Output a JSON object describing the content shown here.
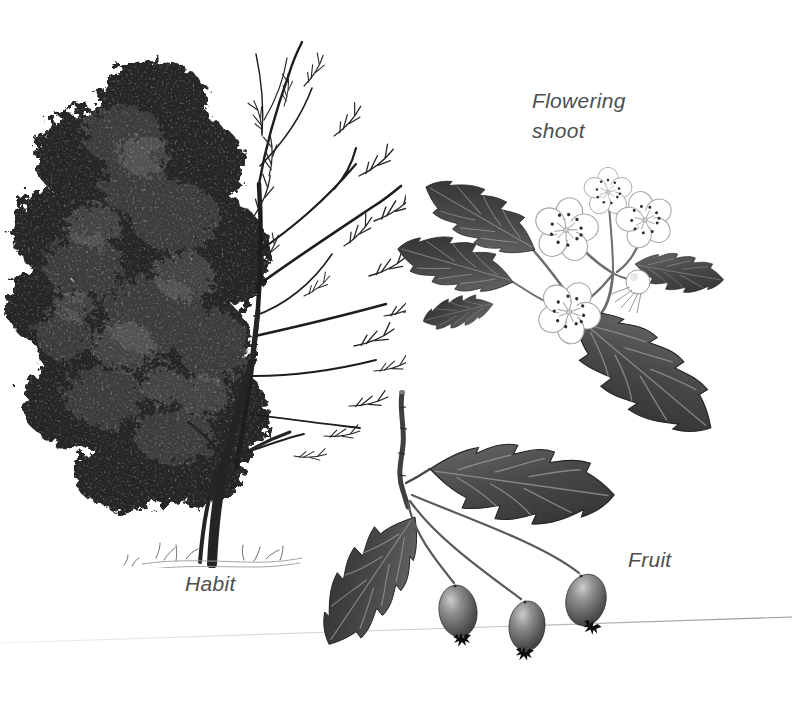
{
  "page": {
    "background": "#ffffff"
  },
  "labels": {
    "flowering_shoot": "Flowering\nshoot",
    "habit": "Habit",
    "fruit": "Fruit"
  },
  "palette": {
    "label_gray": "#4e4e4e",
    "ink_black": "#1d1d1d",
    "ink_dark": "#3a3a3a",
    "ink_mid": "#6d6d6d",
    "ink_light": "#9f9f9f",
    "crease_gray": "#8e8e8e",
    "flower_white": "#ffffff",
    "berry_shade": "#575757"
  },
  "illustrations": {
    "habit": {
      "caption": "Habit",
      "depicts": "deciduous tree shown half in dense leaf (left) and half as bare winter branches (right), trunk with grass tufts at base"
    },
    "flowering_shoot": {
      "caption": "Flowering shoot",
      "depicts": "shoot with deeply lobed serrated leaves, cluster of five-petalled white blossoms with dark anther dots, and one round bud"
    },
    "fruit": {
      "caption": "Fruit",
      "depicts": "cut twig bearing two lobed leaves and three oval berries on slender stalks, each berry tipped with a dark star-shaped calyx"
    }
  }
}
